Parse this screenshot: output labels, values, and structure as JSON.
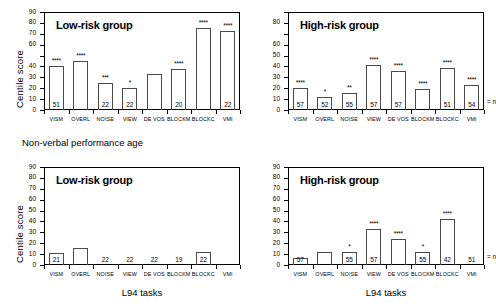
{
  "figure": {
    "section_label": "Non-verbal performance age",
    "xaxis_title": "L94 tasks",
    "yaxis_title": "Centile score",
    "n_legend": "= n"
  },
  "chart_data": [
    {
      "id": "top-left",
      "type": "bar",
      "title": "Low-risk group",
      "xlabel": "",
      "ylabel": "Centile score",
      "ylim": [
        0,
        90
      ],
      "yticks": [
        0,
        10,
        20,
        30,
        40,
        50,
        60,
        70,
        80,
        90
      ],
      "ytick_labels": [
        "0",
        "10",
        "20",
        "30",
        "40",
        "",
        "60",
        "70",
        "80",
        "90"
      ],
      "grid": false,
      "categories": [
        "VISM",
        "OVERL",
        "NOISE",
        "VIEW",
        "DE VOS",
        "BLOCKM",
        "BLOCKC",
        "VMI"
      ],
      "values": [
        40,
        45,
        25,
        20,
        33,
        38,
        75,
        73
      ],
      "significance": [
        "****",
        "****",
        "***",
        "*",
        "",
        "****",
        "****",
        "****"
      ],
      "n": [
        "51",
        "",
        "22",
        "22",
        "",
        "20",
        "",
        "22"
      ]
    },
    {
      "id": "top-right",
      "type": "bar",
      "title": "High-risk group",
      "xlabel": "",
      "ylabel": "",
      "ylim": [
        0,
        90
      ],
      "yticks": [
        0,
        10,
        20,
        30,
        40,
        50,
        60,
        70,
        80,
        90
      ],
      "ytick_labels": [
        "0",
        "10",
        "20",
        "30",
        "40",
        "50",
        "60",
        "",
        "80",
        ""
      ],
      "grid": false,
      "categories": [
        "VISM",
        "OVERL",
        "NOISE",
        "VIEW",
        "DE VOS",
        "BLOCKM",
        "BLOCKC",
        "VMI"
      ],
      "values": [
        20,
        12,
        16,
        41,
        36,
        19,
        39,
        23
      ],
      "significance": [
        "****",
        "*",
        "**",
        "****",
        "****",
        "****",
        "****",
        "****"
      ],
      "n": [
        "57",
        "52",
        "55",
        "57",
        "57",
        "",
        "51",
        "54"
      ]
    },
    {
      "id": "bottom-left",
      "type": "bar",
      "title": "Low-risk group",
      "xlabel": "L94 tasks",
      "ylabel": "Centile score",
      "ylim": [
        0,
        90
      ],
      "yticks": [
        0,
        10,
        20,
        30,
        40,
        50,
        60,
        70,
        80,
        90
      ],
      "ytick_labels": [
        "0",
        "10",
        "20",
        "30",
        "40",
        "50",
        "60",
        "70",
        "80",
        "90"
      ],
      "grid": false,
      "categories": [
        "VISM",
        "OVERL",
        "NOISE",
        "VIEW",
        "DE VOS",
        "BLOCKM",
        "BLOCKC",
        "VMI"
      ],
      "values": [
        11,
        16,
        0,
        0,
        0,
        0,
        12,
        0
      ],
      "significance": [
        "",
        "",
        "",
        "",
        "",
        "",
        "",
        ""
      ],
      "n": [
        "21",
        "",
        "22",
        "22",
        "22",
        "19",
        "22",
        ""
      ]
    },
    {
      "id": "bottom-right",
      "type": "bar",
      "title": "High-risk group",
      "xlabel": "L94 tasks",
      "ylabel": "",
      "ylim": [
        0,
        90
      ],
      "yticks": [
        0,
        10,
        20,
        30,
        40,
        50,
        60,
        70,
        80,
        90
      ],
      "ytick_labels": [
        "0",
        "10",
        "20",
        "30",
        "40",
        "50",
        "60",
        "70",
        "80",
        "90"
      ],
      "grid": false,
      "categories": [
        "VISM",
        "OVERL",
        "NOISE",
        "VIEW",
        "DE VOS",
        "BLOCKM",
        "BLOCKC",
        "VMI"
      ],
      "values": [
        6,
        12,
        12,
        33,
        24,
        12,
        42,
        0
      ],
      "significance": [
        "",
        "",
        "*",
        "****",
        "****",
        "*",
        "****",
        ""
      ],
      "n": [
        "57",
        "",
        "55",
        "57",
        "",
        "55",
        "42",
        "51"
      ]
    }
  ]
}
